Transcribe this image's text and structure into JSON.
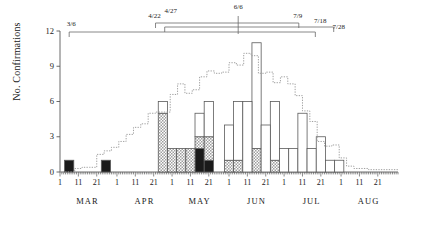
{
  "chart_data": {
    "type": "bar",
    "title": "",
    "xlabel": "",
    "ylabel": "No. Confirmations",
    "ylim": [
      0,
      12
    ],
    "yticks": [
      0,
      3,
      6,
      9,
      12
    ],
    "grid": false,
    "legend_position": "none",
    "x_axis": {
      "start_date": "3/1",
      "end_date": "8/31",
      "day_ticks": [
        1,
        11,
        21
      ],
      "months": [
        "MAR",
        "APR",
        "MAY",
        "JUN",
        "JUL",
        "AUG"
      ]
    },
    "series": [
      {
        "name": "solid-black",
        "fill": "solid",
        "color": "#1a1a1a",
        "values": [
          {
            "date": "3/6",
            "value": 1
          },
          {
            "date": "3/26",
            "value": 1
          },
          {
            "date": "5/16",
            "value": 2
          },
          {
            "date": "5/21",
            "value": 1
          }
        ]
      },
      {
        "name": "hatched-gray",
        "fill": "hatched",
        "color": "#9a9a9a",
        "values": [
          {
            "date": "4/26",
            "value": 5
          },
          {
            "date": "5/1",
            "value": 2
          },
          {
            "date": "5/6",
            "value": 2
          },
          {
            "date": "5/11",
            "value": 2
          },
          {
            "date": "5/16",
            "value": 1
          },
          {
            "date": "5/21",
            "value": 2
          },
          {
            "date": "6/1",
            "value": 1
          },
          {
            "date": "6/6",
            "value": 1
          },
          {
            "date": "6/16",
            "value": 2
          },
          {
            "date": "6/26",
            "value": 1
          }
        ]
      },
      {
        "name": "open-white",
        "fill": "open",
        "color": "#ffffff",
        "values": [
          {
            "date": "4/26",
            "value": 1
          },
          {
            "date": "5/16",
            "value": 2
          },
          {
            "date": "5/21",
            "value": 3
          },
          {
            "date": "6/1",
            "value": 3
          },
          {
            "date": "6/6",
            "value": 5
          },
          {
            "date": "6/11",
            "value": 6
          },
          {
            "date": "6/16",
            "value": 9
          },
          {
            "date": "6/21",
            "value": 4
          },
          {
            "date": "6/26",
            "value": 5
          },
          {
            "date": "7/1",
            "value": 2
          },
          {
            "date": "7/6",
            "value": 2
          },
          {
            "date": "7/11",
            "value": 5
          },
          {
            "date": "7/16",
            "value": 2
          },
          {
            "date": "7/21",
            "value": 3
          },
          {
            "date": "7/26",
            "value": 1
          },
          {
            "date": "7/31",
            "value": 1
          }
        ]
      }
    ],
    "totals_by_bar": [
      {
        "date": "3/6",
        "total": 1
      },
      {
        "date": "3/26",
        "total": 1
      },
      {
        "date": "4/26",
        "total": 6
      },
      {
        "date": "5/1",
        "total": 2
      },
      {
        "date": "5/6",
        "total": 2
      },
      {
        "date": "5/11",
        "total": 2
      },
      {
        "date": "5/16",
        "total": 5
      },
      {
        "date": "5/21",
        "total": 6
      },
      {
        "date": "6/1",
        "total": 4
      },
      {
        "date": "6/6",
        "total": 6
      },
      {
        "date": "6/11",
        "total": 6
      },
      {
        "date": "6/16",
        "total": 11
      },
      {
        "date": "6/21",
        "total": 6
      },
      {
        "date": "6/26",
        "total": 6
      },
      {
        "date": "7/1",
        "total": 3
      },
      {
        "date": "7/6",
        "total": 2
      },
      {
        "date": "7/11",
        "total": 5
      },
      {
        "date": "7/16",
        "total": 2
      },
      {
        "date": "7/21",
        "total": 3
      },
      {
        "date": "7/26",
        "total": 1
      },
      {
        "date": "7/31",
        "total": 1
      }
    ],
    "overlay_curve": {
      "name": "dotted-epidemic-curve",
      "style": "dotted",
      "color": "#9a9a9a",
      "points": [
        {
          "x": 0,
          "y": 0
        },
        {
          "x": 4,
          "y": 0
        },
        {
          "x": 8,
          "y": 0.3
        },
        {
          "x": 12,
          "y": 0.4
        },
        {
          "x": 16,
          "y": 0.4
        },
        {
          "x": 20,
          "y": 1.5
        },
        {
          "x": 24,
          "y": 1.8
        },
        {
          "x": 28,
          "y": 2.1
        },
        {
          "x": 32,
          "y": 2.6
        },
        {
          "x": 36,
          "y": 3.2
        },
        {
          "x": 40,
          "y": 3.8
        },
        {
          "x": 44,
          "y": 4.1
        },
        {
          "x": 48,
          "y": 5.0
        },
        {
          "x": 52,
          "y": 5.1
        },
        {
          "x": 56,
          "y": 5.1
        },
        {
          "x": 60,
          "y": 6.6
        },
        {
          "x": 64,
          "y": 7.5
        },
        {
          "x": 68,
          "y": 6.7
        },
        {
          "x": 72,
          "y": 7.0
        },
        {
          "x": 76,
          "y": 8.1
        },
        {
          "x": 80,
          "y": 8.6
        },
        {
          "x": 84,
          "y": 8.4
        },
        {
          "x": 88,
          "y": 8.5
        },
        {
          "x": 92,
          "y": 9.3
        },
        {
          "x": 96,
          "y": 9.1
        },
        {
          "x": 100,
          "y": 10.1
        },
        {
          "x": 104,
          "y": 9.9
        },
        {
          "x": 108,
          "y": 8.4
        },
        {
          "x": 112,
          "y": 8.5
        },
        {
          "x": 116,
          "y": 7.6
        },
        {
          "x": 120,
          "y": 8.1
        },
        {
          "x": 124,
          "y": 7.5
        },
        {
          "x": 128,
          "y": 6.5
        },
        {
          "x": 132,
          "y": 5.2
        },
        {
          "x": 136,
          "y": 4.3
        },
        {
          "x": 140,
          "y": 2.6
        },
        {
          "x": 144,
          "y": 2.2
        },
        {
          "x": 148,
          "y": 2.3
        },
        {
          "x": 152,
          "y": 1.2
        },
        {
          "x": 156,
          "y": 0.5
        },
        {
          "x": 160,
          "y": 0.3
        },
        {
          "x": 168,
          "y": 0.2
        },
        {
          "x": 176,
          "y": 0.2
        },
        {
          "x": 184,
          "y": 0.1
        }
      ]
    },
    "annotations": {
      "brackets": [
        {
          "label_left": "3/6",
          "label_right": "7/18",
          "level": 3
        },
        {
          "label_left": "4/22",
          "label_right": "7/9",
          "level": 2
        },
        {
          "label_left": "4/27",
          "label_right": "7/28",
          "level": 1
        },
        {
          "label_center": "6/6",
          "level": 0
        }
      ],
      "dates": [
        "3/6",
        "4/22",
        "4/27",
        "6/6",
        "7/9",
        "7/18",
        "7/28"
      ]
    }
  },
  "axes": {
    "y_ticks": [
      "0",
      "3",
      "6",
      "9",
      "12"
    ],
    "x_day_ticks": [
      "1",
      "11",
      "21"
    ],
    "months": [
      "MAR",
      "APR",
      "MAY",
      "JUN",
      "JUL",
      "AUG"
    ],
    "y_axis_title": "No. Confirmations"
  },
  "bracket_labels": {
    "a": "3/6",
    "b": "4/22",
    "c": "4/27",
    "d": "6/6",
    "e": "7/9",
    "f": "7/18",
    "g": "7/28"
  },
  "colors": {
    "axis": "#4d4d4d",
    "bar_outline": "#5a5a5a",
    "solid_fill": "#1a1a1a",
    "hatch_fill": "#9e9e9e",
    "open_fill": "#ffffff",
    "curve": "#a0a0a0",
    "text": "#1a1a1a"
  }
}
